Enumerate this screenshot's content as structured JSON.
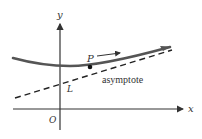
{
  "diagram": {
    "type": "asymptote-illustration",
    "axes": {
      "x_label": "x",
      "y_label": "y",
      "origin_label": "O"
    },
    "curve": {
      "point_label": "P",
      "motion": "P moves along curve to the right, approaching the asymptote"
    },
    "asymptote": {
      "label": "asymptote",
      "line_label": "L",
      "style": "dashed"
    },
    "colors": {
      "curve": "#555555",
      "axes": "#333333",
      "dashed_line": "#222222",
      "text": "#333333"
    }
  }
}
